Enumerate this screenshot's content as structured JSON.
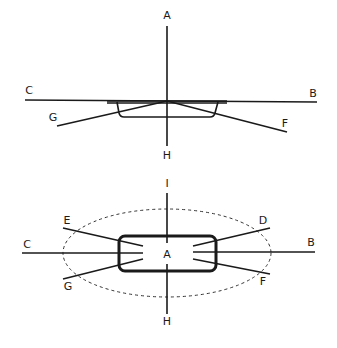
{
  "top_figure": {
    "labels": {
      "A": {
        "text": "A",
        "x": 167,
        "y": 16
      },
      "H": {
        "text": "H",
        "x": 167,
        "y": 156
      },
      "C": {
        "text": "C",
        "x": 29,
        "y": 91
      },
      "B": {
        "text": "B",
        "x": 313,
        "y": 94
      },
      "G": {
        "text": "G",
        "x": 53,
        "y": 118
      },
      "F": {
        "text": "F",
        "x": 285,
        "y": 124
      }
    }
  },
  "bottom_figure": {
    "labels": {
      "I": {
        "text": "I",
        "x": 167,
        "y": 184
      },
      "H": {
        "text": "H",
        "x": 167,
        "y": 322
      },
      "C": {
        "text": "C",
        "x": 27,
        "y": 245
      },
      "B": {
        "text": "B",
        "x": 311,
        "y": 243
      },
      "E": {
        "text": "E",
        "x": 67,
        "y": 221
      },
      "G": {
        "text": "G",
        "x": 68,
        "y": 287
      },
      "D": {
        "text": "D",
        "x": 263,
        "y": 221
      },
      "F": {
        "text": "F",
        "x": 263,
        "y": 282
      },
      "A": {
        "text": "A",
        "x": 167,
        "y": 255
      }
    }
  },
  "colors": {
    "ink": "#1a1a1a",
    "background": "#ffffff"
  }
}
